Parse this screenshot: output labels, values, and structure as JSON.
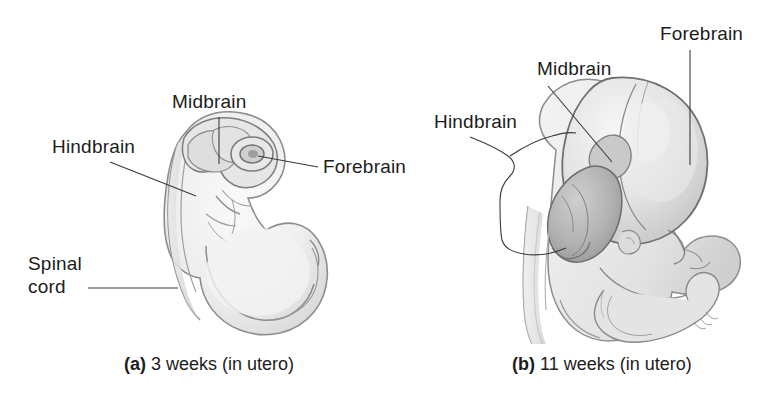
{
  "figure": {
    "background_color": "#ffffff",
    "line_color": "#3a3a3a",
    "text_color": "#1c1c1c",
    "art_fill_light": "#efefef",
    "art_fill_mid": "#d8d8d8",
    "art_fill_dark": "#b4b4b4",
    "art_fill_darker": "#9a9a9a"
  },
  "panels": [
    {
      "id": "panel-a",
      "caption_marker": "(a)",
      "caption_text": "3 weeks (in utero)",
      "labels": [
        {
          "name": "hindbrain",
          "text": "Hindbrain"
        },
        {
          "name": "midbrain",
          "text": "Midbrain"
        },
        {
          "name": "forebrain",
          "text": "Forebrain"
        },
        {
          "name": "spinal-cord-line1",
          "text": "Spinal"
        },
        {
          "name": "spinal-cord-line2",
          "text": "cord"
        }
      ]
    },
    {
      "id": "panel-b",
      "caption_marker": "(b)",
      "caption_text": "11 weeks (in utero)",
      "labels": [
        {
          "name": "hindbrain",
          "text": "Hindbrain"
        },
        {
          "name": "midbrain",
          "text": "Midbrain"
        },
        {
          "name": "forebrain",
          "text": "Forebrain"
        }
      ]
    }
  ]
}
